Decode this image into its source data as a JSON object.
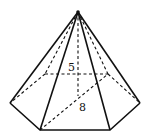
{
  "figure": {
    "type": "hexagonal pyramid",
    "labels": {
      "height": "5",
      "base_segment": "8"
    }
  }
}
